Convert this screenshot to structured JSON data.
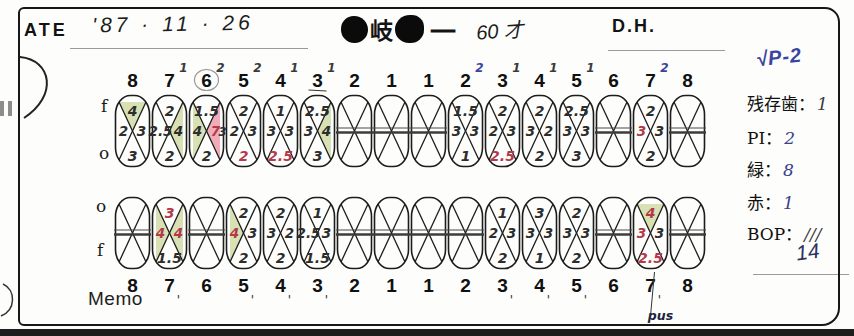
{
  "header": {
    "date_label": "ATE",
    "date_value": "'87 · 11 · 26",
    "patient_name_char": "岐",
    "patient_name_tail": "一",
    "patient_age_text": "60 才",
    "dh_label": "D.H."
  },
  "labels": {
    "f_upper": "f",
    "o_upper": "o",
    "o_lower": "o",
    "f_lower": "f",
    "memo": "Memo"
  },
  "right_panel": {
    "handnote": "√P-2",
    "items": [
      {
        "label": "残存歯：",
        "value": "1"
      },
      {
        "label": "PI：",
        "value": "2"
      },
      {
        "label": "緑：",
        "value": "8"
      },
      {
        "label": "赤：",
        "value": "1"
      },
      {
        "label": "BOP：",
        "value": "///"
      }
    ],
    "bop_extra": "14"
  },
  "colors": {
    "green_shade": "#cdd9a2",
    "pink_shade": "#ec97a8",
    "red_ink": "#b23a4a",
    "blue_ink": "#3a44a0",
    "dark_ink": "#2d2d2d"
  },
  "perio_chart": {
    "upper": [
      {
        "n": "8",
        "t": {
          "v": "4",
          "bg": "g"
        },
        "l": {
          "v": "2"
        },
        "r": {
          "v": "3"
        },
        "b": {
          "v": "3"
        }
      },
      {
        "n": "7",
        "sup": "1",
        "t": {
          "v": "2"
        },
        "l": {
          "v": "2.5"
        },
        "r": {
          "v": "4",
          "bg": "g"
        },
        "b": {
          "v": "2"
        }
      },
      {
        "n": "6",
        "sup": "2",
        "circled": true,
        "t": {
          "v": "1.5"
        },
        "l": {
          "v": "4",
          "bg": "g"
        },
        "r": {
          "v": "7",
          "c": "red",
          "bg": "p",
          "v2": "3"
        },
        "b": {
          "v": "2"
        }
      },
      {
        "n": "5",
        "sup": "2",
        "t": {
          "v": "2"
        },
        "l": {
          "v": "2"
        },
        "r": {
          "v": "3"
        },
        "b": {
          "v": "2",
          "c": "red"
        }
      },
      {
        "n": "4",
        "sup": "1",
        "t": {
          "v": "1"
        },
        "l": {
          "v": "3"
        },
        "r": {
          "v": "3"
        },
        "b": {
          "v": "2.5",
          "c": "red"
        }
      },
      {
        "n": "3",
        "sup": "1",
        "ul": true,
        "t": {
          "v": "2.5"
        },
        "l": {
          "v": "3"
        },
        "r": {
          "v": "4",
          "bg": "g"
        },
        "b": {
          "v": "3"
        }
      },
      {
        "n": "2",
        "missing": true
      },
      {
        "n": "1",
        "missing": true
      },
      {
        "n": "1",
        "missing": true
      },
      {
        "n": "2",
        "sup": "2",
        "supC": "blue",
        "t": {
          "v": "1.5"
        },
        "l": {
          "v": "3"
        },
        "r": {
          "v": "3"
        },
        "b": {
          "v": "1"
        }
      },
      {
        "n": "3",
        "sup": "1",
        "t": {
          "v": "2"
        },
        "l": {
          "v": "2"
        },
        "r": {
          "v": "3"
        },
        "b": {
          "v": "2.5",
          "c": "red"
        }
      },
      {
        "n": "4",
        "sup": "1",
        "t": {
          "v": "2"
        },
        "l": {
          "v": "3"
        },
        "r": {
          "v": "2"
        },
        "b": {
          "v": "2"
        }
      },
      {
        "n": "5",
        "sup": "1",
        "t": {
          "v": "2.5"
        },
        "l": {
          "v": "3"
        },
        "r": {
          "v": "3"
        },
        "b": {
          "v": "3"
        }
      },
      {
        "n": "6",
        "missing": true
      },
      {
        "n": "7",
        "sup": "2",
        "supC": "blue",
        "t": {
          "v": "2"
        },
        "l": {
          "v": "3",
          "c": "red"
        },
        "r": {
          "v": "3"
        },
        "b": {
          "v": "2"
        }
      },
      {
        "n": "8",
        "missing": true
      }
    ],
    "lower": [
      {
        "n": "8",
        "missing": true
      },
      {
        "n": "7",
        "tick": true,
        "t": {
          "v": "3",
          "c": "red"
        },
        "l": {
          "v": "4",
          "c": "red",
          "bg": "g"
        },
        "r": {
          "v": "4",
          "c": "red",
          "bg": "g"
        },
        "b": {
          "v": "1.5"
        }
      },
      {
        "n": "6",
        "missing": true
      },
      {
        "n": "5",
        "tick": true,
        "t": {
          "v": "2"
        },
        "l": {
          "v": "4",
          "c": "red",
          "bg": "g"
        },
        "r": {
          "v": "3"
        },
        "b": {
          "v": "2"
        }
      },
      {
        "n": "4",
        "tick": true,
        "t": {
          "v": "2"
        },
        "l": {
          "v": "3"
        },
        "r": {
          "v": "2"
        },
        "b": {
          "v": "2"
        }
      },
      {
        "n": "3",
        "tick": true,
        "t": {
          "v": "1"
        },
        "l": {
          "v": "2.5"
        },
        "r": {
          "v": "3"
        },
        "b": {
          "v": "1.5"
        }
      },
      {
        "n": "2",
        "missing": true
      },
      {
        "n": "1",
        "missing": true
      },
      {
        "n": "1",
        "missing": true
      },
      {
        "n": "2",
        "missing": true
      },
      {
        "n": "3",
        "tick": true,
        "t": {
          "v": "1"
        },
        "l": {
          "v": "2"
        },
        "r": {
          "v": "3"
        },
        "b": {
          "v": "2"
        }
      },
      {
        "n": "4",
        "tick": true,
        "t": {
          "v": "3"
        },
        "l": {
          "v": "3"
        },
        "r": {
          "v": "3"
        },
        "b": {
          "v": "1"
        }
      },
      {
        "n": "5",
        "tick": true,
        "t": {
          "v": "2"
        },
        "l": {
          "v": "3"
        },
        "r": {
          "v": "3"
        },
        "b": {
          "v": "2"
        }
      },
      {
        "n": "6",
        "missing": true
      },
      {
        "n": "7",
        "tick": true,
        "ann": "pus",
        "t": {
          "v": "4",
          "c": "red",
          "bg": "g"
        },
        "l": {
          "v": "3",
          "c": "red"
        },
        "r": {
          "v": "3"
        },
        "b": {
          "v": "2.5",
          "c": "red"
        }
      },
      {
        "n": "8",
        "missing": true
      }
    ]
  }
}
